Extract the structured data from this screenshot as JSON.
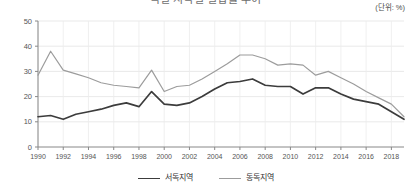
{
  "header": {
    "title_cropped": "독일 지역별 실업률 추이",
    "unit_label": "(단위: %)"
  },
  "legend": {
    "position": "bottom-center",
    "items": [
      {
        "label": "서독지역",
        "color": "#3c3c3c",
        "icon": "line-swatch-icon"
      },
      {
        "label": "동독지역",
        "color": "#9c9c9c",
        "icon": "line-swatch-icon"
      }
    ]
  },
  "axes": {
    "y_ticks": [
      "0",
      "10",
      "20",
      "30",
      "40",
      "50"
    ],
    "x_ticks": [
      "1990",
      "1992",
      "1994",
      "1996",
      "1998",
      "2000",
      "2002",
      "2004",
      "2006",
      "2008",
      "2010",
      "2012",
      "2014",
      "2016",
      "2018"
    ]
  },
  "chart_data": {
    "type": "line",
    "title": "독일 지역별 실업률 추이",
    "xlabel": "",
    "ylabel": "",
    "unit": "(단위: %)",
    "ylim": [
      0,
      50
    ],
    "xlim": [
      1990,
      2019
    ],
    "grid": true,
    "legend_position": "bottom-center",
    "x": [
      1990,
      1991,
      1992,
      1993,
      1994,
      1995,
      1996,
      1997,
      1998,
      1999,
      2000,
      2001,
      2002,
      2003,
      2004,
      2005,
      2006,
      2007,
      2008,
      2009,
      2010,
      2011,
      2012,
      2013,
      2014,
      2015,
      2016,
      2017,
      2018,
      2019
    ],
    "series": [
      {
        "name": "서독지역",
        "color": "#3c3c3c",
        "values": [
          12.0,
          12.5,
          11.0,
          13.0,
          14.0,
          15.0,
          16.5,
          17.5,
          16.0,
          22.0,
          17.0,
          16.5,
          17.5,
          20.0,
          23.0,
          25.5,
          26.0,
          27.0,
          24.5,
          24.0,
          24.0,
          21.0,
          23.5,
          23.5,
          21.0,
          19.0,
          18.0,
          17.0,
          14.0,
          11.0
        ]
      },
      {
        "name": "동독지역",
        "color": "#9c9c9c",
        "values": [
          28.5,
          38.0,
          30.5,
          29.0,
          27.5,
          25.5,
          24.5,
          24.0,
          23.5,
          30.5,
          22.0,
          24.0,
          24.5,
          27.0,
          30.0,
          33.0,
          36.5,
          36.5,
          35.0,
          32.5,
          33.0,
          32.5,
          28.5,
          30.0,
          27.5,
          25.0,
          22.0,
          19.5,
          17.0,
          12.0
        ]
      }
    ]
  }
}
